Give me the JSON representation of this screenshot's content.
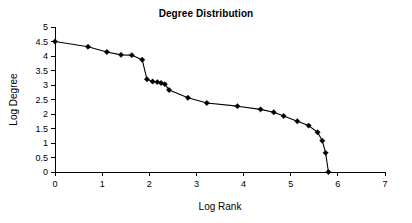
{
  "chart_data": {
    "type": "line",
    "title": "Degree Distribution",
    "xlabel": "Log Rank",
    "ylabel": "Log Degree",
    "xlim": [
      0,
      7
    ],
    "ylim": [
      0,
      5
    ],
    "xticks": [
      "0",
      "1",
      "2",
      "3",
      "4",
      "5",
      "6",
      "7"
    ],
    "yticks": [
      "0",
      "0.5",
      "1",
      "1.5",
      "2",
      "2.5",
      "3",
      "3.5",
      "4",
      "4.5",
      "5"
    ],
    "grid": false,
    "legend": false,
    "marker": "diamond",
    "line_color": "#000000",
    "marker_color": "#000000",
    "background_color": "#ffffff",
    "series": [
      {
        "name": "Degree Distribution",
        "points": [
          [
            0.0,
            4.5
          ],
          [
            0.7,
            4.32
          ],
          [
            1.1,
            4.14
          ],
          [
            1.4,
            4.04
          ],
          [
            1.63,
            4.03
          ],
          [
            1.85,
            3.87
          ],
          [
            1.95,
            3.2
          ],
          [
            2.07,
            3.12
          ],
          [
            2.17,
            3.1
          ],
          [
            2.25,
            3.07
          ],
          [
            2.33,
            3.03
          ],
          [
            2.42,
            2.83
          ],
          [
            2.82,
            2.56
          ],
          [
            3.22,
            2.38
          ],
          [
            3.87,
            2.27
          ],
          [
            4.36,
            2.16
          ],
          [
            4.64,
            2.06
          ],
          [
            4.85,
            1.93
          ],
          [
            5.14,
            1.75
          ],
          [
            5.38,
            1.6
          ],
          [
            5.57,
            1.37
          ],
          [
            5.67,
            1.08
          ],
          [
            5.74,
            0.66
          ],
          [
            5.8,
            0.0
          ]
        ]
      }
    ]
  }
}
